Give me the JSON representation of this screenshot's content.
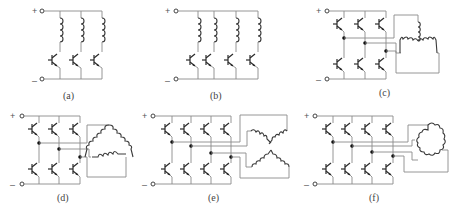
{
  "figure": {
    "panels": [
      {
        "id": "a",
        "label": "(a)",
        "topology": "unipolar",
        "phases": 3,
        "switches": 3,
        "winding": "separate coils"
      },
      {
        "id": "b",
        "label": "(b)",
        "topology": "unipolar",
        "phases": 4,
        "switches": 4,
        "winding": "separate coils"
      },
      {
        "id": "c",
        "label": "(c)",
        "topology": "bridge",
        "phases": 3,
        "switches": 6,
        "winding": "star (Y)"
      },
      {
        "id": "d",
        "label": "(d)",
        "topology": "bridge",
        "phases": 3,
        "switches": 6,
        "winding": "delta"
      },
      {
        "id": "e",
        "label": "(e)",
        "topology": "bridge",
        "phases": 4,
        "switches": 8,
        "winding": "star (X)"
      },
      {
        "id": "f",
        "label": "(f)",
        "topology": "bridge",
        "phases": 4,
        "switches": 8,
        "winding": "ring (closed loop)"
      }
    ],
    "terminals": {
      "positive": "+",
      "negative": "–"
    }
  }
}
